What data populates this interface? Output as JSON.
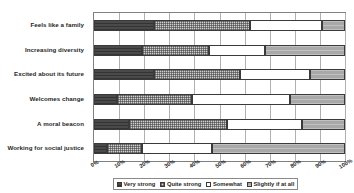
{
  "chart_data": {
    "type": "bar",
    "orientation": "horizontal",
    "stacked": true,
    "stack_total": 100,
    "title": "",
    "subtitle": "",
    "xlabel": "",
    "ylabel": "",
    "xlim": [
      0,
      100
    ],
    "grid": true,
    "legend_position": "bottom",
    "xticklabels": [
      "0%",
      "10%",
      "20%",
      "30%",
      "40%",
      "50%",
      "60%",
      "70%",
      "80%",
      "90%",
      "100%"
    ],
    "xticks": [
      0,
      10,
      20,
      30,
      40,
      50,
      60,
      70,
      80,
      90,
      100
    ],
    "categories": [
      "Feels like a family",
      "Increasing diversity",
      "Excited about its future",
      "Welcomes change",
      "A moral beacon",
      "Working for social justice"
    ],
    "series": [
      {
        "name": "Very strong",
        "color": "#4a4a4a",
        "pattern": "solid-dark",
        "values": [
          24,
          19,
          24,
          9,
          14,
          5
        ]
      },
      {
        "name": "Quite strong",
        "color": "#cfcfcf",
        "pattern": "checkered",
        "values": [
          38,
          27,
          34,
          30,
          39,
          14
        ]
      },
      {
        "name": "Somewhat",
        "color": "#ffffff",
        "pattern": "empty",
        "values": [
          29,
          22,
          28,
          39,
          30,
          28
        ]
      },
      {
        "name": "Slightly if at all",
        "color": "#a8a8a8",
        "pattern": "solid-gray",
        "values": [
          9,
          32,
          14,
          22,
          17,
          53
        ]
      }
    ],
    "cumulative_boundaries": [
      [
        24,
        62,
        91,
        100
      ],
      [
        19,
        46,
        68,
        100
      ],
      [
        24,
        58,
        86,
        100
      ],
      [
        9,
        39,
        78,
        100
      ],
      [
        14,
        53,
        83,
        100
      ],
      [
        5,
        19,
        47,
        100
      ]
    ]
  },
  "legend": {
    "items": [
      {
        "label": "Very strong"
      },
      {
        "label": "Quite strong"
      },
      {
        "label": "Somewhat"
      },
      {
        "label": "Slightly if at all"
      }
    ]
  }
}
